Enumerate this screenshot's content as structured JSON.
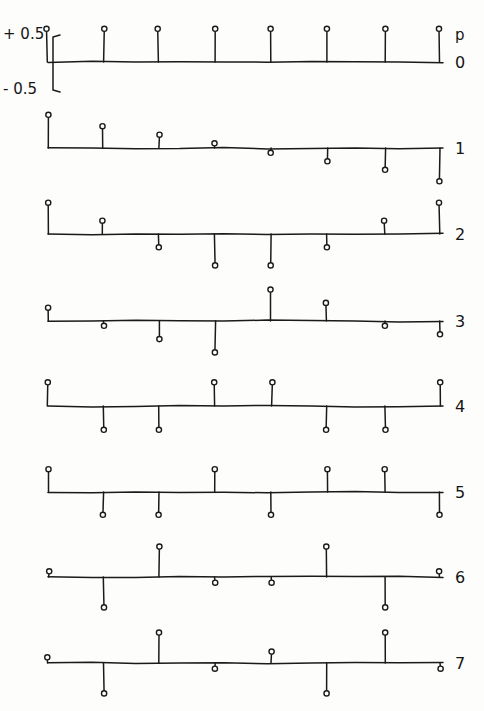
{
  "figure": {
    "kind": "stem-plot-grid",
    "ink_color": "#1a1a1a",
    "paper_color": "#fdfdfb",
    "samples_per_row": 8,
    "scale": {
      "top_label": "+ 0.5",
      "bottom_label": "- 0.5",
      "bracket_top_value": 0.5,
      "bracket_bottom_value": -0.5
    },
    "axis_annotations": {
      "variable_label": "p",
      "first_row_index_label": "0"
    },
    "row_index_labels": [
      "0",
      "1",
      "2",
      "3",
      "4",
      "5",
      "6",
      "7"
    ]
  },
  "chart_data": {
    "type": "bar",
    "title": "",
    "subtitle": "",
    "xlabel": "",
    "ylabel": "",
    "ylim": [
      -0.5,
      0.5
    ],
    "grid": false,
    "legend": "none",
    "x": [
      0,
      1,
      2,
      3,
      4,
      5,
      6,
      7
    ],
    "categories": [
      "0",
      "1",
      "2",
      "3",
      "4",
      "5",
      "6",
      "7"
    ],
    "series": [
      {
        "name": "p = 0",
        "label": "0",
        "values": [
          0.35,
          0.35,
          0.35,
          0.35,
          0.35,
          0.35,
          0.35,
          0.35
        ]
      },
      {
        "name": "p = 1",
        "label": "1",
        "values": [
          0.35,
          0.23,
          0.14,
          0.05,
          -0.05,
          -0.14,
          -0.23,
          -0.35
        ]
      },
      {
        "name": "p = 2",
        "label": "2",
        "values": [
          0.33,
          0.14,
          -0.14,
          -0.33,
          -0.33,
          -0.14,
          0.14,
          0.33
        ]
      },
      {
        "name": "p = 3",
        "label": "3",
        "values": [
          0.14,
          -0.05,
          -0.19,
          -0.33,
          0.33,
          0.19,
          -0.05,
          -0.14
        ]
      },
      {
        "name": "p = 4",
        "label": "4",
        "values": [
          0.25,
          -0.25,
          -0.25,
          0.25,
          0.25,
          -0.25,
          -0.25,
          0.25
        ]
      },
      {
        "name": "p = 5",
        "label": "5",
        "values": [
          0.24,
          -0.24,
          -0.24,
          0.24,
          -0.24,
          0.24,
          0.24,
          -0.24
        ]
      },
      {
        "name": "p = 6",
        "label": "6",
        "values": [
          0.06,
          -0.32,
          0.32,
          -0.06,
          -0.06,
          0.32,
          -0.32,
          0.06
        ]
      },
      {
        "name": "p = 7",
        "label": "7",
        "values": [
          0.06,
          -0.32,
          0.32,
          -0.06,
          0.12,
          -0.32,
          0.32,
          -0.06
        ]
      }
    ]
  },
  "layout": {
    "x_positions": [
      48,
      103,
      159,
      215,
      271,
      327,
      385,
      440
    ],
    "baselines": [
      62,
      148,
      234,
      321,
      406,
      492,
      577,
      663
    ],
    "row_label_x": 455,
    "amplitude_pixels_per_unit": 95,
    "axis_start_x": 48,
    "axis_end_x": 443,
    "bracket": {
      "x": 53,
      "top_y": 35,
      "bottom_y": 92,
      "tick_len": 7
    },
    "scale_text": {
      "top_x": 4,
      "top_y": 14,
      "bottom_x": 4,
      "bottom_y": 92
    },
    "p_label": {
      "x": 455,
      "y": 38
    },
    "zero_label": {
      "x": 455,
      "y": 68
    }
  }
}
